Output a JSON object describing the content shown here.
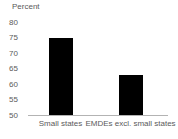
{
  "chart_data": {
    "type": "bar",
    "title": "",
    "ylabel": "Percent",
    "xlabel": "",
    "categories": [
      "Small states",
      "EMDEs excl. small states"
    ],
    "values": [
      75,
      63
    ],
    "ylim": [
      50,
      80
    ],
    "yticks": [
      80,
      75,
      70,
      65,
      60,
      55,
      50
    ],
    "grid": "off",
    "legend": "none",
    "bar_color": "#000000",
    "axis_color": "#b3b3b3",
    "text_color": "#5a5a5a",
    "background_color": "#ffffff"
  }
}
